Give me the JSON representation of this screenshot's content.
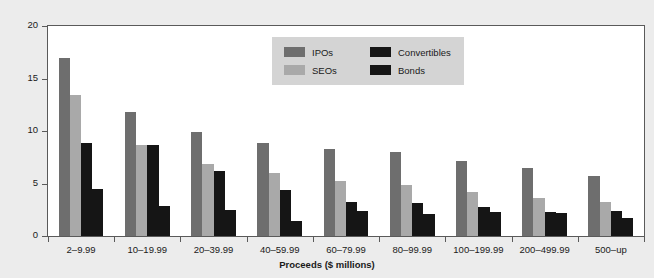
{
  "chart_data": {
    "type": "bar",
    "title": "",
    "xlabel": "Proceeds ($ millions)",
    "ylabel": "Total direct costs (%)",
    "ylim": [
      0,
      20
    ],
    "yticks": [
      0,
      5,
      10,
      15,
      20
    ],
    "ytick_labels": [
      "0",
      "5",
      "10",
      "15",
      "20"
    ],
    "grid": false,
    "legend_position": "top-center-right",
    "categories": [
      "2–9.99",
      "10–19.99",
      "20–39.99",
      "40–59.99",
      "60–79.99",
      "80–99.99",
      "100–199.99",
      "200–499.99",
      "500–up"
    ],
    "series": [
      {
        "name": "IPOs",
        "color": "#6e6e6e",
        "values": [
          17.0,
          11.8,
          9.9,
          8.9,
          8.3,
          8.0,
          7.1,
          6.5,
          5.7
        ]
      },
      {
        "name": "SEOs",
        "color": "#a9a9a9",
        "values": [
          13.4,
          8.7,
          6.9,
          6.0,
          5.2,
          4.9,
          4.2,
          3.6,
          3.2
        ]
      },
      {
        "name": "Convertibles",
        "color": "#151515",
        "values": [
          8.9,
          8.7,
          6.2,
          4.4,
          3.2,
          3.1,
          2.8,
          2.3,
          2.4
        ]
      },
      {
        "name": "Bonds",
        "color": "#151515",
        "values": [
          4.5,
          2.9,
          2.5,
          1.4,
          2.4,
          2.1,
          2.3,
          2.2,
          1.7
        ]
      }
    ]
  },
  "legend": {
    "entries": [
      {
        "label": "IPOs",
        "color": "#6e6e6e"
      },
      {
        "label": "SEOs",
        "color": "#a9a9a9"
      },
      {
        "label": "Convertibles",
        "color": "#151515"
      },
      {
        "label": "Bonds",
        "color": "#151515"
      }
    ]
  },
  "colors": {
    "figure_background": "#ececec",
    "plot_background": "#ffffff",
    "axis": "#5a5a5a",
    "text": "#1a1a1a",
    "legend_background": "#d4d4d4"
  }
}
